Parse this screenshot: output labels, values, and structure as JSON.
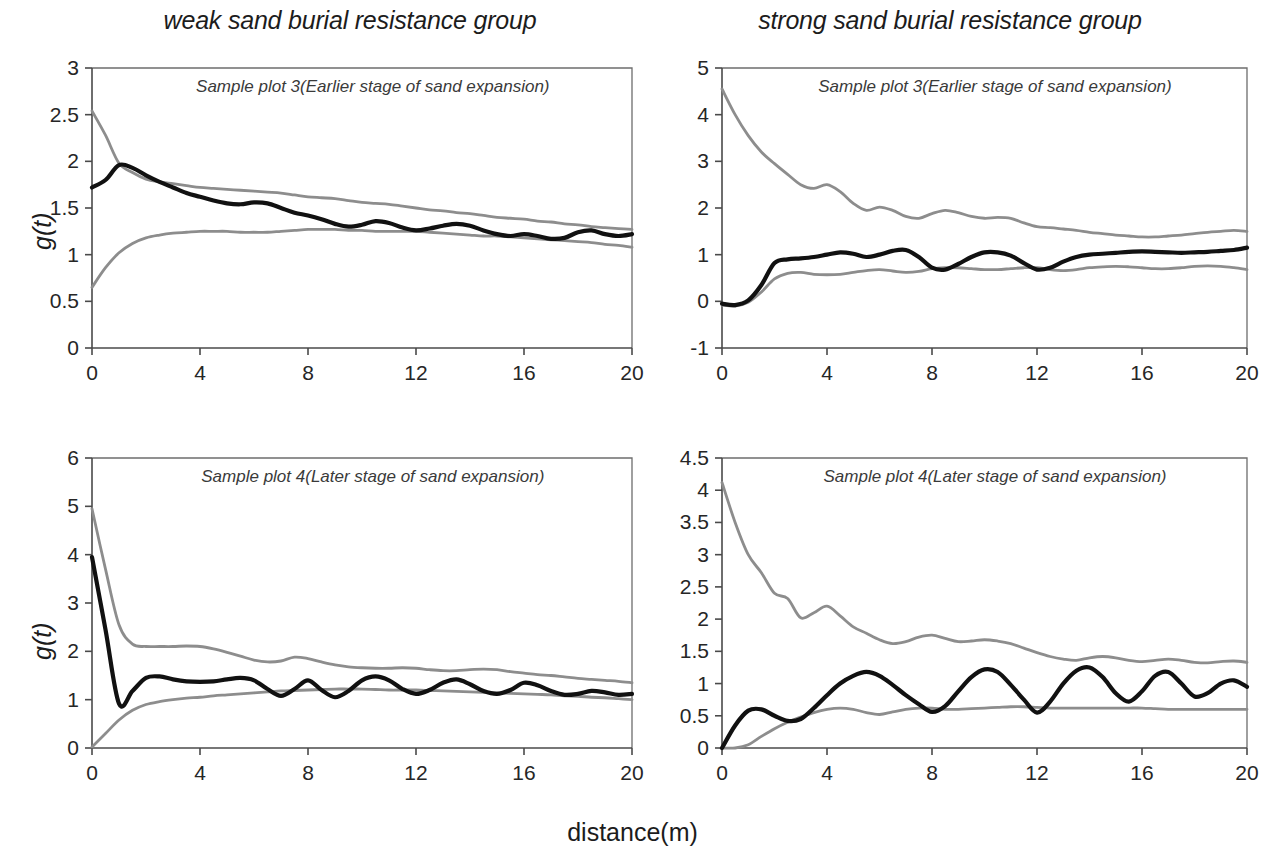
{
  "figure": {
    "left_group_title": "weak sand burial resistance group",
    "right_group_title": "strong sand burial resistance group",
    "x_axis_title": "distance(m)",
    "y_axis_title_top": "g(t)",
    "y_axis_title_bottom": "g(t)",
    "center_curve_color": "#111111",
    "envelope_curve_color": "#8d8d8d"
  },
  "chart_data": [
    {
      "id": "weak-earlier",
      "type": "line",
      "title": "Sample plot 3(Earlier stage of sand expansion)",
      "group": "weak sand burial resistance group",
      "xlabel": "distance(m)",
      "ylabel": "g(t)",
      "xlim": [
        0,
        20
      ],
      "ylim": [
        0,
        3
      ],
      "xticks": [
        0,
        4,
        8,
        12,
        16,
        20
      ],
      "yticks": [
        0,
        0.5,
        1,
        1.5,
        2,
        2.5,
        3
      ],
      "ytick_labels": [
        "0",
        "0.5",
        "1",
        "1.5",
        "2",
        "2.5",
        "3"
      ],
      "grid": false,
      "legend": "none",
      "x": [
        0,
        0.5,
        1,
        1.5,
        2,
        2.5,
        3,
        3.5,
        4,
        4.5,
        5,
        5.5,
        6,
        6.5,
        7,
        7.5,
        8,
        8.5,
        9,
        9.5,
        10,
        10.5,
        11,
        11.5,
        12,
        12.5,
        13,
        13.5,
        14,
        14.5,
        15,
        15.5,
        16,
        16.5,
        17,
        17.5,
        18,
        18.5,
        19,
        19.5,
        20
      ],
      "series": [
        {
          "name": "observed g(t)",
          "role": "center",
          "color": "#111111",
          "values": [
            1.72,
            1.8,
            1.96,
            1.93,
            1.85,
            1.78,
            1.72,
            1.66,
            1.62,
            1.58,
            1.55,
            1.54,
            1.56,
            1.55,
            1.5,
            1.45,
            1.42,
            1.38,
            1.33,
            1.3,
            1.32,
            1.36,
            1.34,
            1.29,
            1.26,
            1.28,
            1.31,
            1.33,
            1.31,
            1.26,
            1.22,
            1.2,
            1.22,
            1.2,
            1.17,
            1.18,
            1.24,
            1.26,
            1.22,
            1.2,
            1.22
          ]
        },
        {
          "name": "upper envelope",
          "role": "upper",
          "color": "#8d8d8d",
          "values": [
            2.54,
            2.28,
            1.98,
            1.88,
            1.81,
            1.78,
            1.76,
            1.74,
            1.72,
            1.71,
            1.7,
            1.69,
            1.68,
            1.67,
            1.66,
            1.64,
            1.62,
            1.61,
            1.6,
            1.58,
            1.56,
            1.55,
            1.54,
            1.52,
            1.5,
            1.48,
            1.47,
            1.45,
            1.44,
            1.42,
            1.4,
            1.39,
            1.38,
            1.36,
            1.35,
            1.33,
            1.32,
            1.3,
            1.29,
            1.28,
            1.27
          ]
        },
        {
          "name": "lower envelope",
          "role": "lower",
          "color": "#8d8d8d",
          "values": [
            0.65,
            0.86,
            1.02,
            1.12,
            1.18,
            1.21,
            1.23,
            1.24,
            1.25,
            1.25,
            1.25,
            1.24,
            1.24,
            1.24,
            1.25,
            1.26,
            1.27,
            1.27,
            1.27,
            1.26,
            1.26,
            1.25,
            1.25,
            1.25,
            1.25,
            1.24,
            1.23,
            1.22,
            1.21,
            1.2,
            1.2,
            1.19,
            1.18,
            1.17,
            1.16,
            1.15,
            1.14,
            1.13,
            1.11,
            1.1,
            1.08
          ]
        }
      ]
    },
    {
      "id": "strong-earlier",
      "type": "line",
      "title": "Sample plot 3(Earlier stage of sand expansion)",
      "group": "strong sand burial resistance group",
      "xlabel": "distance(m)",
      "ylabel": "g(t)",
      "xlim": [
        0,
        20
      ],
      "ylim": [
        -1,
        5
      ],
      "xticks": [
        0,
        4,
        8,
        12,
        16,
        20
      ],
      "yticks": [
        -1,
        0,
        1,
        2,
        3,
        4,
        5
      ],
      "ytick_labels": [
        "-1",
        "0",
        "1",
        "2",
        "3",
        "4",
        "5"
      ],
      "grid": false,
      "legend": "none",
      "x": [
        0,
        0.5,
        1,
        1.5,
        2,
        2.5,
        3,
        3.5,
        4,
        4.5,
        5,
        5.5,
        6,
        6.5,
        7,
        7.5,
        8,
        8.5,
        9,
        9.5,
        10,
        10.5,
        11,
        11.5,
        12,
        12.5,
        13,
        13.5,
        14,
        14.5,
        15,
        15.5,
        16,
        16.5,
        17,
        17.5,
        18,
        18.5,
        19,
        19.5,
        20
      ],
      "series": [
        {
          "name": "observed g(t)",
          "role": "center",
          "color": "#111111",
          "values": [
            -0.05,
            -0.08,
            0.02,
            0.35,
            0.82,
            0.9,
            0.92,
            0.95,
            1.0,
            1.05,
            1.02,
            0.95,
            1.0,
            1.08,
            1.1,
            0.95,
            0.72,
            0.68,
            0.8,
            0.95,
            1.05,
            1.05,
            0.98,
            0.82,
            0.68,
            0.72,
            0.85,
            0.95,
            1.0,
            1.02,
            1.04,
            1.06,
            1.07,
            1.06,
            1.05,
            1.04,
            1.05,
            1.06,
            1.08,
            1.1,
            1.15
          ]
        },
        {
          "name": "upper envelope",
          "role": "upper",
          "color": "#8d8d8d",
          "values": [
            4.55,
            4.0,
            3.55,
            3.2,
            2.95,
            2.72,
            2.5,
            2.42,
            2.5,
            2.35,
            2.1,
            1.95,
            2.02,
            1.95,
            1.82,
            1.78,
            1.88,
            1.95,
            1.9,
            1.82,
            1.78,
            1.8,
            1.78,
            1.68,
            1.6,
            1.58,
            1.55,
            1.52,
            1.48,
            1.45,
            1.42,
            1.4,
            1.38,
            1.38,
            1.4,
            1.42,
            1.45,
            1.48,
            1.5,
            1.52,
            1.5
          ]
        },
        {
          "name": "lower envelope",
          "role": "lower",
          "color": "#8d8d8d",
          "values": [
            -0.08,
            -0.1,
            -0.02,
            0.2,
            0.48,
            0.6,
            0.62,
            0.58,
            0.57,
            0.58,
            0.62,
            0.66,
            0.68,
            0.65,
            0.62,
            0.64,
            0.7,
            0.72,
            0.72,
            0.7,
            0.68,
            0.68,
            0.7,
            0.72,
            0.72,
            0.68,
            0.66,
            0.68,
            0.72,
            0.74,
            0.75,
            0.74,
            0.72,
            0.7,
            0.7,
            0.72,
            0.75,
            0.76,
            0.75,
            0.72,
            0.68
          ]
        }
      ]
    },
    {
      "id": "weak-later",
      "type": "line",
      "title": "Sample plot 4(Later stage of sand expansion)",
      "group": "weak sand burial resistance group",
      "xlabel": "distance(m)",
      "ylabel": "g(t)",
      "xlim": [
        0,
        20
      ],
      "ylim": [
        0,
        6
      ],
      "xticks": [
        0,
        4,
        8,
        12,
        16,
        20
      ],
      "yticks": [
        0,
        1,
        2,
        3,
        4,
        5,
        6
      ],
      "ytick_labels": [
        "0",
        "1",
        "2",
        "3",
        "4",
        "5",
        "6"
      ],
      "grid": false,
      "legend": "none",
      "x": [
        0,
        0.5,
        1,
        1.5,
        2,
        2.5,
        3,
        3.5,
        4,
        4.5,
        5,
        5.5,
        6,
        6.5,
        7,
        7.5,
        8,
        8.5,
        9,
        9.5,
        10,
        10.5,
        11,
        11.5,
        12,
        12.5,
        13,
        13.5,
        14,
        14.5,
        15,
        15.5,
        16,
        16.5,
        17,
        17.5,
        18,
        18.5,
        19,
        19.5,
        20
      ],
      "series": [
        {
          "name": "observed g(t)",
          "role": "center",
          "color": "#111111",
          "values": [
            3.95,
            2.45,
            0.92,
            1.18,
            1.45,
            1.48,
            1.42,
            1.38,
            1.37,
            1.38,
            1.42,
            1.45,
            1.4,
            1.22,
            1.08,
            1.22,
            1.4,
            1.2,
            1.05,
            1.18,
            1.4,
            1.48,
            1.4,
            1.22,
            1.12,
            1.2,
            1.35,
            1.42,
            1.32,
            1.18,
            1.12,
            1.2,
            1.35,
            1.3,
            1.18,
            1.1,
            1.12,
            1.18,
            1.15,
            1.1,
            1.12
          ]
        },
        {
          "name": "upper envelope",
          "role": "upper",
          "color": "#8d8d8d",
          "values": [
            4.95,
            3.7,
            2.55,
            2.15,
            2.1,
            2.1,
            2.1,
            2.11,
            2.1,
            2.05,
            1.98,
            1.9,
            1.82,
            1.78,
            1.8,
            1.88,
            1.85,
            1.78,
            1.72,
            1.68,
            1.66,
            1.65,
            1.65,
            1.66,
            1.65,
            1.62,
            1.6,
            1.6,
            1.62,
            1.63,
            1.62,
            1.58,
            1.55,
            1.52,
            1.5,
            1.47,
            1.44,
            1.42,
            1.4,
            1.38,
            1.35
          ]
        },
        {
          "name": "lower envelope",
          "role": "lower",
          "color": "#8d8d8d",
          "values": [
            0.02,
            0.3,
            0.58,
            0.78,
            0.9,
            0.96,
            1.0,
            1.03,
            1.05,
            1.08,
            1.1,
            1.12,
            1.14,
            1.16,
            1.18,
            1.19,
            1.2,
            1.21,
            1.22,
            1.22,
            1.22,
            1.21,
            1.2,
            1.2,
            1.2,
            1.19,
            1.18,
            1.17,
            1.16,
            1.15,
            1.14,
            1.13,
            1.12,
            1.11,
            1.1,
            1.08,
            1.07,
            1.05,
            1.04,
            1.02,
            1.0
          ]
        }
      ]
    },
    {
      "id": "strong-later",
      "type": "line",
      "title": "Sample plot 4(Later stage of sand expansion)",
      "group": "strong sand burial resistance group",
      "xlabel": "distance(m)",
      "ylabel": "g(t)",
      "xlim": [
        0,
        20
      ],
      "ylim": [
        0,
        4.5
      ],
      "xticks": [
        0,
        4,
        8,
        12,
        16,
        20
      ],
      "yticks": [
        0,
        0.5,
        1,
        1.5,
        2,
        2.5,
        3,
        3.5,
        4,
        4.5
      ],
      "ytick_labels": [
        "0",
        "0.5",
        "1",
        "1.5",
        "2",
        "2.5",
        "3",
        "3.5",
        "4",
        "4.5"
      ],
      "grid": false,
      "legend": "none",
      "x": [
        0,
        0.5,
        1,
        1.5,
        2,
        2.5,
        3,
        3.5,
        4,
        4.5,
        5,
        5.5,
        6,
        6.5,
        7,
        7.5,
        8,
        8.5,
        9,
        9.5,
        10,
        10.5,
        11,
        11.5,
        12,
        12.5,
        13,
        13.5,
        14,
        14.5,
        15,
        15.5,
        16,
        16.5,
        17,
        17.5,
        18,
        18.5,
        19,
        19.5,
        20
      ],
      "series": [
        {
          "name": "observed g(t)",
          "role": "center",
          "color": "#111111",
          "values": [
            0.0,
            0.35,
            0.58,
            0.6,
            0.5,
            0.42,
            0.45,
            0.62,
            0.82,
            1.0,
            1.12,
            1.18,
            1.12,
            0.98,
            0.82,
            0.68,
            0.56,
            0.65,
            0.88,
            1.1,
            1.22,
            1.18,
            0.98,
            0.75,
            0.55,
            0.72,
            1.0,
            1.2,
            1.25,
            1.1,
            0.85,
            0.72,
            0.88,
            1.12,
            1.18,
            1.0,
            0.8,
            0.85,
            1.0,
            1.05,
            0.95
          ]
        },
        {
          "name": "upper envelope",
          "role": "upper",
          "color": "#8d8d8d",
          "values": [
            4.12,
            3.5,
            3.0,
            2.72,
            2.4,
            2.32,
            2.02,
            2.1,
            2.2,
            2.05,
            1.88,
            1.78,
            1.68,
            1.62,
            1.65,
            1.72,
            1.75,
            1.7,
            1.65,
            1.66,
            1.68,
            1.66,
            1.62,
            1.55,
            1.48,
            1.42,
            1.38,
            1.36,
            1.4,
            1.42,
            1.4,
            1.36,
            1.34,
            1.36,
            1.38,
            1.36,
            1.33,
            1.32,
            1.34,
            1.35,
            1.33
          ]
        },
        {
          "name": "lower envelope",
          "role": "lower",
          "color": "#8d8d8d",
          "values": [
            0.0,
            0.0,
            0.05,
            0.18,
            0.3,
            0.4,
            0.48,
            0.55,
            0.6,
            0.62,
            0.6,
            0.55,
            0.52,
            0.56,
            0.6,
            0.62,
            0.62,
            0.6,
            0.6,
            0.61,
            0.62,
            0.63,
            0.64,
            0.64,
            0.63,
            0.62,
            0.62,
            0.62,
            0.62,
            0.62,
            0.62,
            0.62,
            0.62,
            0.61,
            0.6,
            0.6,
            0.6,
            0.6,
            0.6,
            0.6,
            0.6
          ]
        }
      ]
    }
  ]
}
